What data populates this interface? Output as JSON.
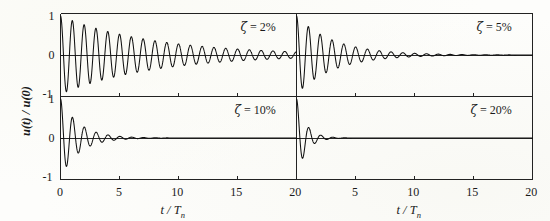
{
  "figure": {
    "background_color": "#fdfdfb",
    "line_color": "#111111",
    "axis_color": "#222222"
  },
  "axes": {
    "ylabel_main": "u(t)",
    "ylabel_sep": " / ",
    "ylabel_ref": "u(0)",
    "xlabel_num": "t",
    "xlabel_sep": " / ",
    "xlabel_den": "T",
    "xlabel_sub": "n",
    "y_ticks": [
      "1",
      "0",
      "-1"
    ],
    "x_ticks_left": [
      "0",
      "5",
      "10",
      "15",
      "20"
    ],
    "x_ticks_right": [
      "5",
      "10",
      "15",
      "20"
    ],
    "x_shared_boundary_tick": "20"
  },
  "panels": [
    {
      "id": "tl",
      "zeta_symbol": "ζ",
      "equals": " = ",
      "zeta_value": "2%",
      "label": "ζ = 2%",
      "zeta": 0.02,
      "row": 0,
      "col": 0
    },
    {
      "id": "tr",
      "zeta_symbol": "ζ",
      "equals": " = ",
      "zeta_value": "5%",
      "label": "ζ = 5%",
      "zeta": 0.05,
      "row": 0,
      "col": 1
    },
    {
      "id": "bl",
      "zeta_symbol": "ζ",
      "equals": " = ",
      "zeta_value": "10%",
      "label": "ζ = 10%",
      "zeta": 0.1,
      "row": 1,
      "col": 0
    },
    {
      "id": "br",
      "zeta_symbol": "ζ",
      "equals": " = ",
      "zeta_value": "20%",
      "label": "ζ = 20%",
      "zeta": 0.2,
      "row": 1,
      "col": 1
    }
  ],
  "chart_data": {
    "type": "line",
    "title": "",
    "subtitle": "",
    "xlabel": "t / Tn",
    "ylabel": "u(t) / u(0)",
    "xlim": [
      0,
      20
    ],
    "ylim": [
      -1,
      1
    ],
    "grid": false,
    "legend": "none",
    "panel_layout": "2x2",
    "x_tick_values": [
      0,
      5,
      10,
      15,
      20
    ],
    "y_tick_values": [
      1,
      0,
      -1
    ],
    "formula": "u(t)/u(0) = exp(-2*pi*zeta*tau/sqrt(1-zeta^2)) * ( cos(2*pi*sqrt(1-zeta^2)*tau) + zeta/sqrt(1-zeta^2) * sin(2*pi*sqrt(1-zeta^2)*tau) ), tau = t/Tn",
    "series": [
      {
        "name": "zeta = 2%",
        "panel": "tl",
        "zeta": 0.02,
        "annotation": "ζ = 2%",
        "peak_envelope_tau": [
          0,
          1,
          2,
          3,
          4,
          5,
          6,
          7,
          8,
          9,
          10,
          11,
          12,
          13,
          14,
          15,
          16,
          17,
          18,
          19,
          20
        ],
        "peak_envelope_value": [
          1.0,
          0.882,
          0.778,
          0.686,
          0.605,
          0.534,
          0.471,
          0.415,
          0.366,
          0.323,
          0.285,
          0.251,
          0.222,
          0.196,
          0.172,
          0.152,
          0.134,
          0.118,
          0.104,
          0.092,
          0.081
        ]
      },
      {
        "name": "zeta = 5%",
        "panel": "tr",
        "zeta": 0.05,
        "annotation": "ζ = 5%",
        "peak_envelope_tau": [
          0,
          1,
          2,
          3,
          4,
          5,
          6,
          7,
          8,
          9,
          10,
          11,
          12,
          13,
          14,
          15,
          16,
          17,
          18,
          19,
          20
        ],
        "peak_envelope_value": [
          1.0,
          0.73,
          0.533,
          0.389,
          0.284,
          0.208,
          0.152,
          0.111,
          0.081,
          0.059,
          0.043,
          0.031,
          0.023,
          0.017,
          0.012,
          0.009,
          0.006,
          0.005,
          0.003,
          0.002,
          0.002
        ]
      },
      {
        "name": "zeta = 10%",
        "panel": "bl",
        "zeta": 0.1,
        "annotation": "ζ = 10%",
        "peak_envelope_tau": [
          0,
          1,
          2,
          3,
          4,
          5,
          6,
          7,
          8,
          9,
          10,
          11,
          12,
          13,
          14,
          15,
          16,
          17,
          18,
          19,
          20
        ],
        "peak_envelope_value": [
          1.0,
          0.533,
          0.285,
          0.152,
          0.081,
          0.043,
          0.023,
          0.012,
          0.007,
          0.004,
          0.002,
          0.001,
          0.0005,
          0.0003,
          0.0002,
          0.0001,
          5e-05,
          3e-05,
          1e-05,
          1e-05,
          0.0
        ]
      },
      {
        "name": "zeta = 20%",
        "panel": "br",
        "zeta": 0.2,
        "annotation": "ζ = 20%",
        "peak_envelope_tau": [
          0,
          1,
          2,
          3,
          4,
          5,
          6,
          7,
          8,
          9,
          10,
          11,
          12,
          13,
          14,
          15,
          16,
          17,
          18,
          19,
          20
        ],
        "peak_envelope_value": [
          1.0,
          0.279,
          0.078,
          0.022,
          0.006,
          0.002,
          0.0005,
          0.0001,
          4e-05,
          1e-05,
          0.0,
          0.0,
          0.0,
          0.0,
          0.0,
          0.0,
          0.0,
          0.0,
          0.0,
          0.0,
          0.0
        ]
      }
    ]
  }
}
